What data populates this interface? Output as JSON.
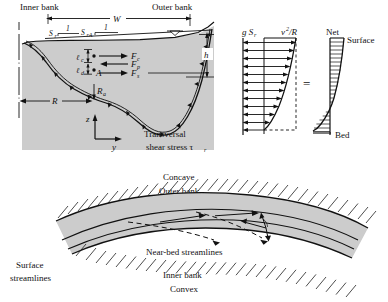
{
  "figure": {
    "title_present": false,
    "background_color": "#ffffff",
    "water_fill_color": "#cccccc",
    "line_color": "#111111"
  },
  "cross_section": {
    "inner_bank_label": "Inner bank",
    "outer_bank_label": "Outer bank",
    "width_label": "W",
    "depth_label": "h",
    "radius_label": "R",
    "radius_a_label": "R",
    "radius_a_sub": "a",
    "slope_label_1": "S",
    "slope_label_1_sub": "r",
    "slope_ratio_1": "1",
    "slope_label_2": "S",
    "slope_label_2_sub": "rA",
    "slope_ratio_2": "1",
    "point_label": "A",
    "length_c_label": "ℓ",
    "length_c_sub": "c",
    "length_d_label": "ℓ",
    "length_d_sub": "d",
    "force_c_label": "F",
    "force_c_sub": "c",
    "force_p_label": "F",
    "force_p_sub": "p",
    "force_s_label": "F",
    "force_s_sub": "s",
    "axis_z_label": "z",
    "axis_y_label": "y",
    "shear_line1": "Transversal",
    "shear_line2": "shear stress τ",
    "shear_sub": "r"
  },
  "velocity_profiles": {
    "gravity_term": "g S",
    "gravity_term_sub": "r",
    "centrifugal_term": "v",
    "centrifugal_sup": "2",
    "centrifugal_denom": "/R",
    "equals_sign": "=",
    "net_label": "Net",
    "surface_label": "Surface",
    "bed_label": "Bed",
    "n_arrow_rows": 12
  },
  "plan_view": {
    "concave_label": "Concave",
    "outer_bank_label": "Outer bank",
    "inner_bank_label": "Inner bank",
    "convex_label": "Convex",
    "surface_streamlines_line1": "Surface",
    "surface_streamlines_line2": "streamlines",
    "near_bed_streamlines_label": "Near-bed streamlines"
  }
}
